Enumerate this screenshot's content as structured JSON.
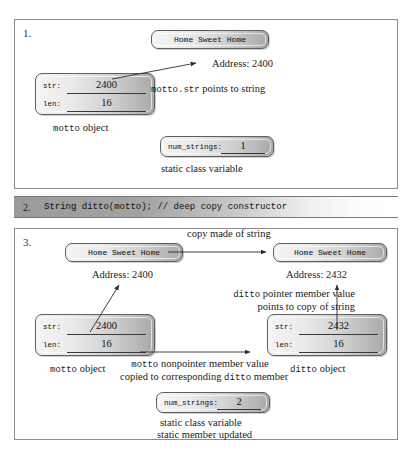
{
  "figure": {
    "panel1": {
      "number": "1.",
      "string_box": "Home Sweet Home",
      "address_label": "Address: 2400",
      "object": {
        "field1_label": "str:",
        "field1_value": "2400",
        "field2_label": "len:",
        "field2_value": "16",
        "caption_mono": "motto",
        "caption_rest": " object"
      },
      "pointer_note_mono": "motto.str",
      "pointer_note_rest": " points to string",
      "static_box": {
        "label": "num_strings:",
        "value": "1"
      },
      "static_caption": "static class variable"
    },
    "panel2": {
      "number": "2.",
      "code": "String ditto(motto); // deep copy constructor"
    },
    "panel3": {
      "number": "3.",
      "left_string_box": "Home Sweet Home",
      "right_string_box": "Home Sweet Home",
      "copy_arrow_label": "copy made of string",
      "left_address_label": "Address: 2400",
      "right_address_label": "Address: 2432",
      "ditto_note_line1_mono": "ditto",
      "ditto_note_line1_rest": " pointer member value",
      "ditto_note_line2": "points to copy of string",
      "motto_object": {
        "field1_label": "str:",
        "field1_value": "2400",
        "field2_label": "len:",
        "field2_value": "16",
        "caption_mono": "motto",
        "caption_rest": " object"
      },
      "ditto_object": {
        "field1_label": "str:",
        "field1_value": "2432",
        "field2_label": "len:",
        "field2_value": "16",
        "caption_mono": "ditto",
        "caption_rest": " object"
      },
      "copy_note_line1_mono": "motto",
      "copy_note_line1_rest": " nonpointer member value",
      "copy_note_line2_pre": "copied to corresponding ",
      "copy_note_line2_mono": "ditto",
      "copy_note_line2_post": " member",
      "static_box": {
        "label": "num_strings:",
        "value": "2"
      },
      "static_caption_line1": "static class variable",
      "static_caption_line2": "static member updated"
    }
  }
}
